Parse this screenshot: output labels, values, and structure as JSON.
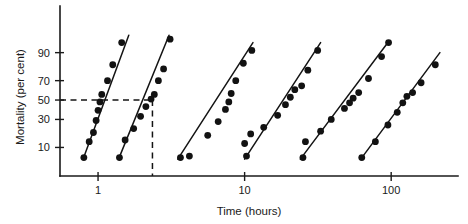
{
  "chart_data": {
    "type": "scatter",
    "title": "",
    "subtitle": "",
    "xlabel": "Time (hours)",
    "ylabel": "Mortality (per cent)",
    "xscale": "log",
    "yscale": "probit",
    "xlim": [
      0.55,
      260
    ],
    "ylim": [
      2,
      99
    ],
    "xticks": [
      1,
      10,
      100
    ],
    "xtick_labels": [
      "1",
      "10",
      "100"
    ],
    "yticks": [
      10,
      30,
      50,
      70,
      90
    ],
    "ytick_labels": [
      "10",
      "30",
      "50",
      "70",
      "90"
    ],
    "grid": false,
    "legend": null,
    "legend_position": "none",
    "marker": "filled-circle",
    "annotations": [
      {
        "name": "lt50-horizontal-guide",
        "type": "dashed-horizontal",
        "y": 50,
        "x_from": 0.55,
        "x_to": 2.35
      },
      {
        "name": "lt50-vertical-guide",
        "type": "dashed-vertical",
        "x": 2.35,
        "y_from": 50,
        "y_to": 2
      }
    ],
    "series": [
      {
        "name": "series-1",
        "fit_line": {
          "x": [
            0.79,
            1.62
          ],
          "y": [
            5.5,
            96.0
          ]
        },
        "points": [
          {
            "x": 0.8,
            "y": 6.0
          },
          {
            "x": 0.87,
            "y": 13.0
          },
          {
            "x": 0.93,
            "y": 19.0
          },
          {
            "x": 0.97,
            "y": 29.0
          },
          {
            "x": 1.0,
            "y": 39.0
          },
          {
            "x": 1.03,
            "y": 48.0
          },
          {
            "x": 1.06,
            "y": 56.0
          },
          {
            "x": 1.16,
            "y": 70.0
          },
          {
            "x": 1.26,
            "y": 83.0
          },
          {
            "x": 1.45,
            "y": 94.0
          }
        ]
      },
      {
        "name": "series-2",
        "fit_line": {
          "x": [
            1.38,
            3.05
          ],
          "y": [
            5.5,
            96.0
          ]
        },
        "points": [
          {
            "x": 1.4,
            "y": 6.0
          },
          {
            "x": 1.53,
            "y": 14.0
          },
          {
            "x": 1.75,
            "y": 22.0
          },
          {
            "x": 1.95,
            "y": 33.0
          },
          {
            "x": 2.12,
            "y": 43.0
          },
          {
            "x": 2.3,
            "y": 51.0
          },
          {
            "x": 2.42,
            "y": 56.0
          },
          {
            "x": 2.58,
            "y": 70.0
          },
          {
            "x": 2.8,
            "y": 80.0
          },
          {
            "x": 3.1,
            "y": 95.0
          }
        ]
      },
      {
        "name": "series-3",
        "fit_line": {
          "x": [
            3.5,
            11.4
          ],
          "y": [
            5.5,
            94.0
          ]
        },
        "points": [
          {
            "x": 3.65,
            "y": 6.0
          },
          {
            "x": 4.2,
            "y": 6.5
          },
          {
            "x": 5.6,
            "y": 17.0
          },
          {
            "x": 6.6,
            "y": 28.0
          },
          {
            "x": 7.4,
            "y": 40.0
          },
          {
            "x": 7.8,
            "y": 48.0
          },
          {
            "x": 8.1,
            "y": 57.0
          },
          {
            "x": 8.7,
            "y": 70.0
          },
          {
            "x": 9.8,
            "y": 84.0
          },
          {
            "x": 11.2,
            "y": 91.0
          }
        ]
      },
      {
        "name": "series-4",
        "fit_line": {
          "x": [
            10.0,
            33.0
          ],
          "y": [
            5.5,
            94.0
          ]
        },
        "points": [
          {
            "x": 10.3,
            "y": 6.5
          },
          {
            "x": 10.0,
            "y": 12.0
          },
          {
            "x": 11.0,
            "y": 18.0
          },
          {
            "x": 13.5,
            "y": 23.0
          },
          {
            "x": 16.8,
            "y": 34.0
          },
          {
            "x": 19.0,
            "y": 45.0
          },
          {
            "x": 20.5,
            "y": 53.0
          },
          {
            "x": 22.0,
            "y": 61.0
          },
          {
            "x": 24.5,
            "y": 65.0
          },
          {
            "x": 27.0,
            "y": 79.0
          },
          {
            "x": 31.5,
            "y": 91.0
          }
        ]
      },
      {
        "name": "series-5",
        "fit_line": {
          "x": [
            24.0,
            95.0
          ],
          "y": [
            5.5,
            94.0
          ]
        },
        "points": [
          {
            "x": 25.0,
            "y": 6.0
          },
          {
            "x": 26.0,
            "y": 13.0
          },
          {
            "x": 33.0,
            "y": 20.0
          },
          {
            "x": 39.0,
            "y": 30.0
          },
          {
            "x": 48.0,
            "y": 41.0
          },
          {
            "x": 52.0,
            "y": 47.0
          },
          {
            "x": 55.0,
            "y": 52.0
          },
          {
            "x": 60.0,
            "y": 58.0
          },
          {
            "x": 70.0,
            "y": 72.0
          },
          {
            "x": 86.0,
            "y": 88.0
          },
          {
            "x": 96.0,
            "y": 94.0
          }
        ]
      },
      {
        "name": "series-6",
        "fit_line": {
          "x": [
            62.0,
            215.0
          ],
          "y": [
            5.5,
            90.0
          ]
        },
        "points": [
          {
            "x": 63.0,
            "y": 6.0
          },
          {
            "x": 78.0,
            "y": 13.0
          },
          {
            "x": 95.0,
            "y": 25.0
          },
          {
            "x": 110.0,
            "y": 37.0
          },
          {
            "x": 120.0,
            "y": 47.0
          },
          {
            "x": 128.0,
            "y": 54.0
          },
          {
            "x": 140.0,
            "y": 58.0
          },
          {
            "x": 160.0,
            "y": 68.0
          },
          {
            "x": 200.0,
            "y": 83.0
          }
        ]
      }
    ]
  },
  "colors": {
    "background": "#ffffff",
    "axis": "#1a1a1a",
    "marker": "#121212",
    "fit_line": "#141414",
    "guide_line": "#141414"
  }
}
